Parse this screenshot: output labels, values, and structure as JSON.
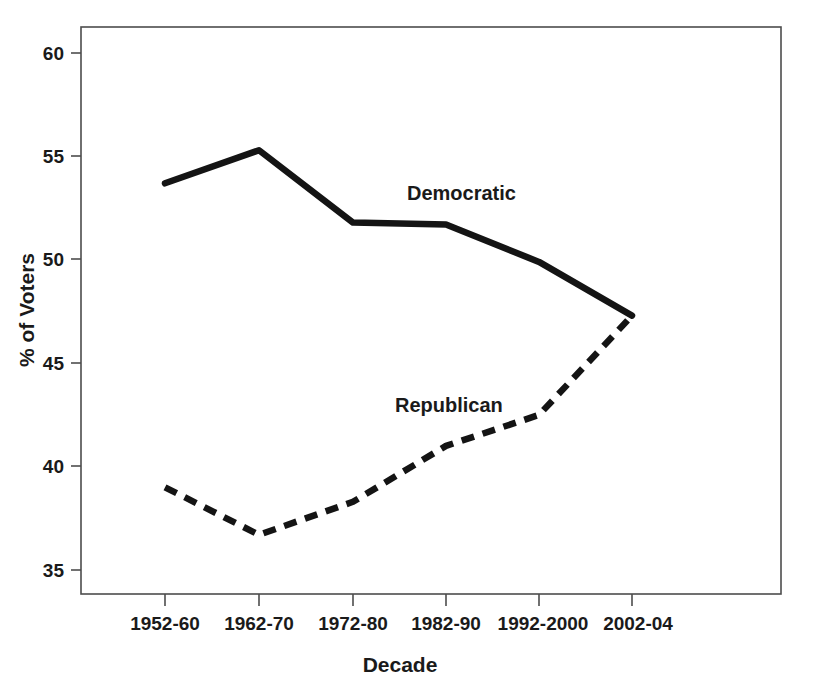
{
  "chart_data": {
    "type": "line",
    "title": "",
    "subtitle": "",
    "xlabel": "Decade",
    "ylabel": "% of Voters",
    "categories": [
      "1952-60",
      "1962-70",
      "1972-80",
      "1982-90",
      "1992-2000",
      "2002-04"
    ],
    "series": [
      {
        "name": "Democratic",
        "style": "solid",
        "color": "#141414",
        "values": [
          53.7,
          55.3,
          51.8,
          51.7,
          49.9,
          47.3
        ]
      },
      {
        "name": "Republican",
        "style": "dashed",
        "color": "#141414",
        "values": [
          39.0,
          36.7,
          38.3,
          41.0,
          42.5,
          47.3
        ]
      }
    ],
    "ylim": [
      33.5,
      61.5
    ],
    "yticks": [
      35,
      40,
      45,
      50,
      55,
      60
    ],
    "ytick_labels": [
      "35",
      "40",
      "45",
      "50",
      "55",
      "60"
    ],
    "xtick_labels": [
      "1952-60",
      "1962-70",
      "1972-80",
      "1982-90",
      "1992-2000",
      "2002-04"
    ],
    "grid": false,
    "legend": "inline-annotations",
    "annotations": [
      {
        "text": "Democratic",
        "x_category": "1972-80",
        "y_value": 53.2
      },
      {
        "text": "Republican",
        "x_category": "1982-90",
        "y_value": 43.3
      }
    ]
  },
  "axis": {
    "y_label": "% of Voters",
    "x_label": "Decade"
  },
  "series_labels": {
    "democratic": "Democratic",
    "republican": "Republican"
  }
}
